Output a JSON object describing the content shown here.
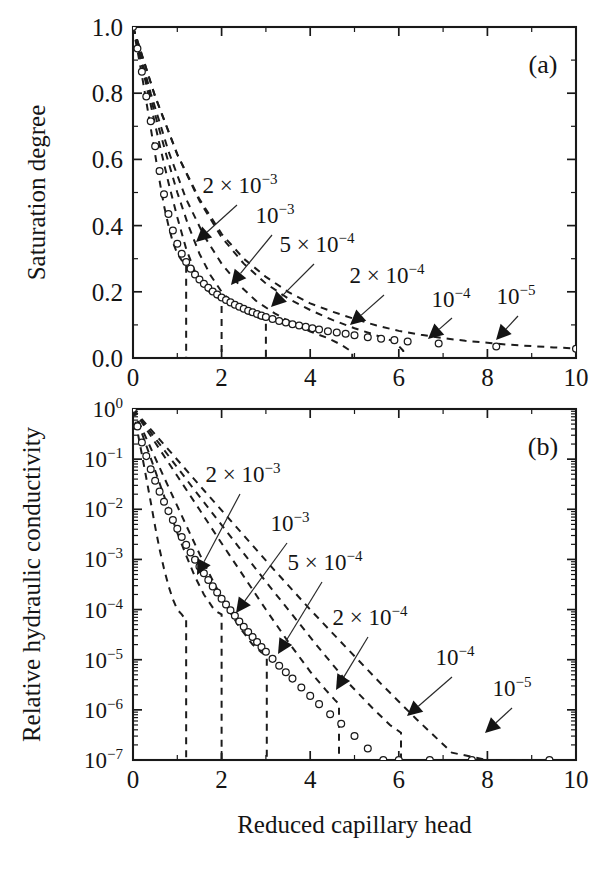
{
  "figure": {
    "caption_panels": [
      "(a)",
      "(b)"
    ],
    "shared_xlabel": "Reduced capillary head"
  },
  "chart_data": [
    {
      "id": "panel-a",
      "type": "line",
      "panel_label": "(a)",
      "title": "",
      "xlabel": "",
      "ylabel": "Saturation degree",
      "xlim": [
        0,
        10
      ],
      "ylim": [
        0,
        1
      ],
      "yscale": "linear",
      "xscale": "linear",
      "xticks": [
        0,
        2,
        4,
        6,
        8,
        10
      ],
      "xticklabels": [
        "0",
        "2",
        "4",
        "6",
        "8",
        "10"
      ],
      "yticks": [
        0.0,
        0.2,
        0.4,
        0.6,
        0.8,
        1.0
      ],
      "yticklabels": [
        "0.0",
        "0.2",
        "0.4",
        "0.6",
        "0.8",
        "1.0"
      ],
      "xminor_count": 1,
      "yminor_count": 1,
      "grid": false,
      "legend": "inline-annotations",
      "annotations": [
        {
          "text_mantissa": "2 × 10",
          "text_exp": "−3",
          "label": "2 × 10⁻³",
          "text_x": 240,
          "text_y": 193,
          "arrow_from": [
            237,
            205
          ],
          "arrow_to": [
            196,
            242
          ],
          "curve": "2e-3"
        },
        {
          "text_mantissa": "10",
          "text_exp": "−3",
          "label": "10⁻³",
          "text_x": 275,
          "text_y": 223,
          "arrow_from": [
            272,
            235
          ],
          "arrow_to": [
            231,
            285
          ],
          "curve": "1e-3"
        },
        {
          "text_mantissa": "5 × 10",
          "text_exp": "−4",
          "label": "5 × 10⁻⁴",
          "text_x": 317,
          "text_y": 252,
          "arrow_from": [
            314,
            264
          ],
          "arrow_to": [
            271,
            307
          ],
          "curve": "5e-4"
        },
        {
          "text_mantissa": "2 × 10",
          "text_exp": "−4",
          "label": "2 × 10⁻⁴",
          "text_x": 387,
          "text_y": 283,
          "arrow_from": [
            384,
            295
          ],
          "arrow_to": [
            350,
            325
          ],
          "curve": "2e-4"
        },
        {
          "text_mantissa": "10",
          "text_exp": "−4",
          "label": "10⁻⁴",
          "text_x": 451,
          "text_y": 307,
          "arrow_from": [
            452,
            318
          ],
          "arrow_to": [
            428,
            339
          ],
          "curve": "1e-4"
        },
        {
          "text_mantissa": "10",
          "text_exp": "−5",
          "label": "10⁻⁵",
          "text_x": 516,
          "text_y": 304,
          "arrow_from": [
            518,
            316
          ],
          "arrow_to": [
            496,
            340
          ],
          "curve": "1e-5"
        }
      ],
      "series": [
        {
          "name": "2e-3",
          "label": "2 × 10⁻³",
          "style": "dashed",
          "cutoff_x": 1.2,
          "points_x": [
            0.0,
            0.1,
            0.2,
            0.3,
            0.4,
            0.5,
            0.6,
            0.7,
            0.8,
            0.9,
            1.0,
            1.1,
            1.15,
            1.2
          ],
          "points_y": [
            1.0,
            0.93,
            0.855,
            0.775,
            0.695,
            0.615,
            0.535,
            0.46,
            0.4,
            0.35,
            0.315,
            0.295,
            0.29,
            0.285
          ]
        },
        {
          "name": "1e-3",
          "label": "10⁻³",
          "style": "dashed",
          "cutoff_x": 2.0,
          "points_x": [
            0.0,
            0.2,
            0.4,
            0.6,
            0.8,
            1.0,
            1.2,
            1.4,
            1.6,
            1.8,
            1.9,
            2.0
          ],
          "points_y": [
            1.0,
            0.885,
            0.765,
            0.645,
            0.53,
            0.425,
            0.33,
            0.26,
            0.215,
            0.19,
            0.183,
            0.178
          ]
        },
        {
          "name": "5e-4",
          "label": "5 × 10⁻⁴",
          "style": "dashed",
          "cutoff_x": 3.0,
          "points_x": [
            0.0,
            0.25,
            0.5,
            0.75,
            1.0,
            1.25,
            1.5,
            1.75,
            2.0,
            2.25,
            2.5,
            2.75,
            3.0
          ],
          "points_y": [
            1.0,
            0.865,
            0.735,
            0.615,
            0.5,
            0.4,
            0.315,
            0.25,
            0.2,
            0.165,
            0.14,
            0.125,
            0.115
          ]
        },
        {
          "name": "2e-4",
          "label": "2 × 10⁻⁴",
          "style": "dashed",
          "cutoff_x": 4.95,
          "points_x": [
            0.0,
            0.4,
            0.8,
            1.2,
            1.6,
            2.0,
            2.4,
            2.8,
            3.2,
            3.6,
            4.0,
            4.4,
            4.7,
            4.95
          ],
          "points_y": [
            1.0,
            0.8,
            0.625,
            0.48,
            0.37,
            0.285,
            0.22,
            0.17,
            0.135,
            0.105,
            0.08,
            0.06,
            0.04,
            0.018
          ]
        },
        {
          "name": "1e-4",
          "label": "10⁻⁴",
          "style": "dashed",
          "cutoff_x": 6.1,
          "points_x": [
            0.0,
            0.5,
            1.0,
            1.5,
            2.0,
            2.5,
            3.0,
            3.5,
            4.0,
            4.5,
            5.0,
            5.5,
            5.9,
            6.1
          ],
          "points_y": [
            1.0,
            0.79,
            0.615,
            0.475,
            0.365,
            0.285,
            0.225,
            0.18,
            0.145,
            0.115,
            0.09,
            0.068,
            0.05,
            0.022
          ]
        },
        {
          "name": "1e-5",
          "label": "10⁻⁵",
          "style": "dashed",
          "cutoff_x": 10.0,
          "points_x": [
            0.0,
            0.5,
            1.0,
            1.5,
            2.0,
            2.5,
            3.0,
            3.5,
            4.0,
            4.5,
            5.0,
            5.5,
            6.0,
            6.5,
            7.0,
            7.5,
            8.0,
            8.5,
            9.0,
            9.5,
            10.0
          ],
          "points_y": [
            1.0,
            0.79,
            0.615,
            0.48,
            0.375,
            0.3,
            0.245,
            0.2,
            0.165,
            0.14,
            0.118,
            0.098,
            0.082,
            0.07,
            0.06,
            0.052,
            0.046,
            0.04,
            0.036,
            0.032,
            0.029
          ]
        }
      ],
      "markers": {
        "name": "simulation-data",
        "shape": "open-circle",
        "points_x": [
          0.0,
          0.1,
          0.2,
          0.3,
          0.4,
          0.5,
          0.6,
          0.7,
          0.8,
          0.9,
          1.0,
          1.1,
          1.2,
          1.3,
          1.4,
          1.5,
          1.6,
          1.7,
          1.8,
          1.9,
          2.0,
          2.1,
          2.2,
          2.3,
          2.4,
          2.5,
          2.6,
          2.7,
          2.8,
          2.9,
          3.0,
          3.15,
          3.3,
          3.45,
          3.6,
          3.75,
          3.9,
          4.05,
          4.2,
          4.4,
          4.6,
          4.8,
          5.0,
          5.3,
          5.6,
          5.9,
          6.2,
          6.9,
          8.2,
          10.0
        ],
        "points_y": [
          1.0,
          0.935,
          0.865,
          0.79,
          0.715,
          0.64,
          0.565,
          0.495,
          0.435,
          0.385,
          0.345,
          0.315,
          0.29,
          0.27,
          0.252,
          0.237,
          0.224,
          0.212,
          0.201,
          0.192,
          0.183,
          0.175,
          0.168,
          0.161,
          0.155,
          0.149,
          0.143,
          0.138,
          0.133,
          0.128,
          0.124,
          0.118,
          0.112,
          0.107,
          0.102,
          0.098,
          0.094,
          0.09,
          0.086,
          0.081,
          0.077,
          0.073,
          0.069,
          0.063,
          0.058,
          0.054,
          0.05,
          0.044,
          0.035,
          0.028
        ]
      }
    },
    {
      "id": "panel-b",
      "type": "line",
      "panel_label": "(b)",
      "title": "",
      "xlabel": "Reduced capillary head",
      "ylabel": "Relative hydraulic conductivity",
      "xlim": [
        0,
        10
      ],
      "ylim": [
        1e-07,
        1
      ],
      "yscale": "log",
      "xscale": "linear",
      "xticks": [
        0,
        2,
        4,
        6,
        8,
        10
      ],
      "xticklabels": [
        "0",
        "2",
        "4",
        "6",
        "8",
        "10"
      ],
      "yticks": [
        1,
        0.1,
        0.01,
        0.001,
        0.0001,
        1e-05,
        1e-06,
        1e-07
      ],
      "yticklabels": [
        "10⁰",
        "10⁻¹",
        "10⁻²",
        "10⁻³",
        "10⁻⁴",
        "10⁻⁵",
        "10⁻⁶",
        "10⁻⁷"
      ],
      "ytick_mantissa": "10",
      "ytick_exponents": [
        "0",
        "−1",
        "−2",
        "−3",
        "−4",
        "−5",
        "−6",
        "−7"
      ],
      "xminor_count": 1,
      "grid": false,
      "legend": "inline-annotations",
      "annotations": [
        {
          "text_mantissa": "2 × 10",
          "text_exp": "−3",
          "label": "2 × 10⁻³",
          "text_x": 243,
          "text_y": 482,
          "arrow_from": [
            240,
            494
          ],
          "arrow_to": [
            197,
            575
          ],
          "curve": "2e-3"
        },
        {
          "text_mantissa": "10",
          "text_exp": "−3",
          "label": "10⁻³",
          "text_x": 290,
          "text_y": 531,
          "arrow_from": [
            287,
            543
          ],
          "arrow_to": [
            236,
            613
          ],
          "curve": "1e-3"
        },
        {
          "text_mantissa": "5 × 10",
          "text_exp": "−4",
          "label": "5 × 10⁻⁴",
          "text_x": 325,
          "text_y": 570,
          "arrow_from": [
            322,
            582
          ],
          "arrow_to": [
            278,
            654
          ],
          "curve": "5e-4"
        },
        {
          "text_mantissa": "2 × 10",
          "text_exp": "−4",
          "label": "2 × 10⁻⁴",
          "text_x": 370,
          "text_y": 625,
          "arrow_from": [
            368,
            637
          ],
          "arrow_to": [
            336,
            690
          ],
          "curve": "2e-4"
        },
        {
          "text_mantissa": "10",
          "text_exp": "−4",
          "label": "10⁻⁴",
          "text_x": 455,
          "text_y": 665,
          "arrow_from": [
            452,
            677
          ],
          "arrow_to": [
            407,
            716
          ],
          "curve": "1e-4"
        },
        {
          "text_mantissa": "10",
          "text_exp": "−5",
          "label": "10⁻⁵",
          "text_x": 512,
          "text_y": 696,
          "arrow_from": [
            512,
            708
          ],
          "arrow_to": [
            485,
            733
          ],
          "curve": "1e-5"
        }
      ],
      "series": [
        {
          "name": "2e-3",
          "label": "2 × 10⁻³",
          "style": "dashed",
          "cutoff_x": 1.2,
          "points_x": [
            0.0,
            0.1,
            0.2,
            0.3,
            0.4,
            0.5,
            0.6,
            0.7,
            0.8,
            0.9,
            1.0,
            1.1,
            1.15,
            1.2
          ],
          "points_y": [
            1.0,
            0.36,
            0.125,
            0.042,
            0.014,
            0.0045,
            0.0016,
            0.00065,
            0.0003,
            0.00016,
            0.0001,
            8e-05,
            7e-05,
            7e-05
          ]
        },
        {
          "name": "1e-3",
          "label": "10⁻³",
          "style": "dashed",
          "cutoff_x": 2.0,
          "points_x": [
            0.0,
            0.2,
            0.4,
            0.6,
            0.8,
            1.0,
            1.2,
            1.4,
            1.6,
            1.8,
            1.9,
            2.0
          ],
          "points_y": [
            1.0,
            0.33,
            0.105,
            0.033,
            0.0105,
            0.0034,
            0.0012,
            0.00045,
            0.0002,
            0.00011,
            9e-05,
            8e-05
          ]
        },
        {
          "name": "5e-4",
          "label": "5 × 10⁻⁴",
          "style": "dashed",
          "cutoff_x": 3.02,
          "points_x": [
            0.0,
            0.3,
            0.6,
            0.9,
            1.2,
            1.5,
            1.8,
            2.1,
            2.4,
            2.7,
            2.9,
            3.02
          ],
          "points_y": [
            1.0,
            0.26,
            0.068,
            0.018,
            0.0048,
            0.0013,
            0.00038,
            0.00012,
            4.5e-05,
            2e-05,
            1.4e-05,
            1.2e-05
          ]
        },
        {
          "name": "2e-4",
          "label": "2 × 10⁻⁴",
          "style": "dashed",
          "cutoff_x": 4.65,
          "points_x": [
            0.0,
            0.5,
            1.0,
            1.5,
            2.0,
            2.5,
            3.0,
            3.5,
            4.0,
            4.35,
            4.55,
            4.65
          ],
          "points_y": [
            1.0,
            0.215,
            0.046,
            0.0099,
            0.0021,
            0.00046,
            0.0001,
            2.3e-05,
            5.8e-06,
            2.5e-06,
            1.6e-06,
            1.3e-06
          ]
        },
        {
          "name": "1e-4",
          "label": "10⁻⁴",
          "style": "dashed",
          "cutoff_x": 6.05,
          "points_x": [
            0.0,
            0.6,
            1.2,
            1.8,
            2.4,
            3.0,
            3.6,
            4.2,
            4.8,
            5.4,
            5.8,
            6.05
          ],
          "points_y": [
            1.0,
            0.2,
            0.04,
            0.0082,
            0.0017,
            0.00036,
            7.8e-05,
            1.7e-05,
            3.9e-06,
            1.1e-06,
            5e-07,
            3.5e-07
          ]
        },
        {
          "name": "1e-5",
          "label": "10⁻⁵",
          "style": "dashed",
          "cutoff_x": 9.45,
          "points_x": [
            0.0,
            0.8,
            1.6,
            2.4,
            3.2,
            4.0,
            4.8,
            5.6,
            6.4,
            7.2,
            8.0,
            8.8,
            9.45
          ],
          "points_y": [
            1.0,
            0.155,
            0.024,
            0.0038,
            0.0006,
            0.0001,
            1.8e-05,
            3.3e-06,
            6.5e-07,
            1.4e-07,
            4e-08,
            1.4e-08,
            8.5e-09
          ]
        }
      ],
      "markers": {
        "name": "simulation-data",
        "shape": "open-circle",
        "points_x": [
          0.0,
          0.1,
          0.2,
          0.3,
          0.4,
          0.5,
          0.6,
          0.7,
          0.8,
          0.9,
          1.0,
          1.1,
          1.2,
          1.3,
          1.4,
          1.5,
          1.6,
          1.7,
          1.8,
          1.9,
          2.0,
          2.1,
          2.2,
          2.3,
          2.4,
          2.5,
          2.6,
          2.7,
          2.8,
          2.9,
          3.0,
          3.15,
          3.3,
          3.45,
          3.6,
          3.8,
          4.0,
          4.2,
          4.45,
          4.7,
          5.0,
          5.3,
          5.65,
          6.0,
          6.7,
          7.65,
          9.4
        ],
        "points_y": [
          1.0,
          0.45,
          0.215,
          0.115,
          0.063,
          0.037,
          0.0225,
          0.0142,
          0.0092,
          0.0061,
          0.0041,
          0.0028,
          0.00195,
          0.00138,
          0.00099,
          0.00072,
          0.00053,
          0.00039,
          0.00029,
          0.00022,
          0.000165,
          0.000126,
          9.7e-05,
          7.5e-05,
          5.8e-05,
          4.55e-05,
          3.58e-05,
          2.83e-05,
          2.25e-05,
          1.8e-05,
          1.44e-05,
          1.04e-05,
          7.6e-06,
          5.6e-06,
          4.2e-06,
          2.8e-06,
          1.9e-06,
          1.3e-06,
          8.2e-07,
          5.3e-07,
          3e-07,
          1.7e-07,
          1e-07,
          6e-08,
          2.2e-08,
          6.8e-09,
          1.1e-09
        ]
      }
    }
  ]
}
